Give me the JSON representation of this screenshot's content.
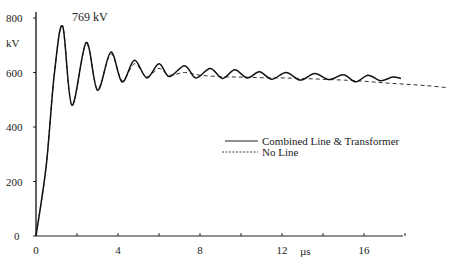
{
  "chart_data": {
    "type": "line",
    "title": "",
    "xlabel": "µs",
    "ylabel": "kV",
    "xlim": [
      0,
      20
    ],
    "ylim": [
      0,
      800
    ],
    "grid": false,
    "legend_position": "right-middle",
    "x_ticks": [
      "0",
      "4",
      "8",
      "12",
      "16"
    ],
    "x_minor_ticks": [
      2,
      6,
      10,
      14,
      18
    ],
    "y_ticks": [
      "0",
      "200",
      "400",
      "600",
      "800"
    ],
    "annotations": [
      {
        "text": "769 kV",
        "x": 1.3,
        "y": 769
      }
    ],
    "series": [
      {
        "name": "Combined Line & Transformer",
        "style": "solid",
        "x": [
          0,
          0.5,
          0.9,
          1.3,
          1.75,
          2.45,
          3.0,
          3.65,
          4.2,
          4.8,
          5.4,
          6.0,
          6.5,
          7.25,
          7.8,
          8.5,
          9.1,
          9.7,
          10.3,
          10.9,
          11.5,
          12.2,
          12.9,
          13.6,
          14.3,
          15.0,
          15.6,
          16.2,
          16.8,
          17.4,
          17.8
        ],
        "values": [
          0,
          260,
          600,
          769,
          480,
          710,
          535,
          675,
          565,
          645,
          580,
          632,
          585,
          625,
          580,
          615,
          578,
          610,
          580,
          603,
          575,
          600,
          572,
          596,
          574,
          592,
          566,
          590,
          570,
          583,
          578
        ]
      },
      {
        "name": "No Line",
        "style": "dashed",
        "x": [
          0,
          0.5,
          0.9,
          1.3,
          1.75,
          2.45,
          3.0,
          3.65,
          4.2,
          4.8,
          5.4,
          6.0,
          6.5,
          7.25,
          8.0,
          9.0,
          10.0,
          11.0,
          12.0,
          13.0,
          14.0,
          15.0,
          16.0,
          17.0,
          18.0,
          19.0,
          20.0
        ],
        "values": [
          0,
          260,
          600,
          769,
          480,
          705,
          540,
          668,
          570,
          632,
          585,
          615,
          590,
          600,
          590,
          585,
          583,
          581,
          580,
          578,
          575,
          572,
          568,
          562,
          557,
          552,
          545
        ]
      }
    ]
  },
  "legend": {
    "items": [
      {
        "label": "Combined Line & Transformer",
        "style": "solid"
      },
      {
        "label": "No Line",
        "style": "dashed"
      }
    ]
  },
  "axes": {
    "y_unit": "kV",
    "x_unit": "µs",
    "peak_annotation": "769 kV"
  }
}
